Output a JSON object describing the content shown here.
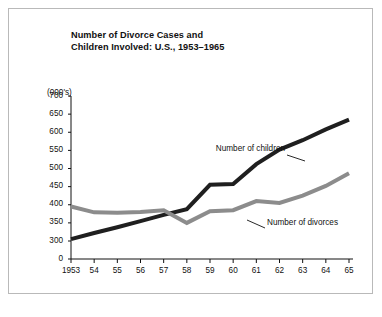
{
  "figure": {
    "title": "Number of Divorce Cases and\nChildren Involved: U.S., 1953–1965",
    "unit_label": "(000's)"
  },
  "chart_data": {
    "type": "line",
    "xlabel": "",
    "ylabel": "(000's)",
    "categories": [
      "1953",
      "54",
      "55",
      "56",
      "57",
      "58",
      "59",
      "60",
      "61",
      "62",
      "63",
      "64",
      "65"
    ],
    "x_tick_labels": [
      "1953",
      "54",
      "55",
      "56",
      "57",
      "58",
      "59",
      "60",
      "61",
      "62",
      "63",
      "64",
      "65"
    ],
    "y_tick_labels": [
      "0",
      "300",
      "350",
      "400",
      "450",
      "500",
      "550",
      "600",
      "650",
      "700"
    ],
    "y_ticks": [
      0,
      300,
      350,
      400,
      450,
      500,
      550,
      600,
      650,
      700
    ],
    "ylim": [
      300,
      700
    ],
    "y_axis_break": true,
    "grid": false,
    "legend": "annotations-on-lines",
    "series": [
      {
        "name": "Number of children",
        "color": "#1f1f1f",
        "values": [
          305,
          322,
          338,
          355,
          372,
          388,
          455,
          457,
          512,
          552,
          578,
          608,
          635
        ]
      },
      {
        "name": "Number of divorces",
        "color": "#8c8c8c",
        "values": [
          395,
          379,
          378,
          380,
          385,
          350,
          382,
          385,
          410,
          405,
          425,
          452,
          487
        ]
      }
    ],
    "annotations": [
      {
        "text": "Number of children",
        "series": "Number of children"
      },
      {
        "text": "Number of divorces",
        "series": "Number of divorces"
      }
    ]
  }
}
